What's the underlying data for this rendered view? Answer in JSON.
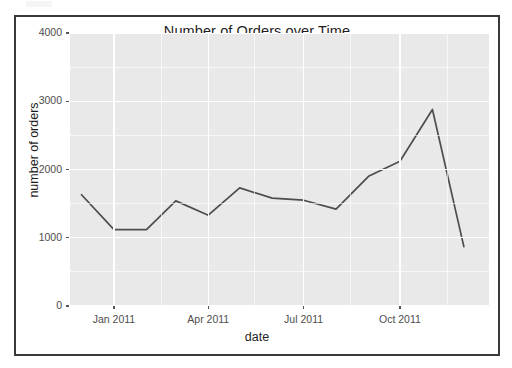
{
  "figure": {
    "title": "Number of Orders over Time",
    "background": "#ffffff",
    "panel_background": "#e9e9e9",
    "grid_color": "#ffffff",
    "border_color": "#3a3a3a",
    "line_color": "#4d4d4d"
  },
  "chart_data": {
    "type": "line",
    "title": "Number of Orders over Time",
    "xlabel": "date",
    "ylabel": "number of orders",
    "x": [
      "2010-12-01",
      "2011-01-01",
      "2011-02-01",
      "2011-03-01",
      "2011-04-01",
      "2011-05-01",
      "2011-06-01",
      "2011-07-01",
      "2011-08-01",
      "2011-09-01",
      "2011-10-01",
      "2011-11-01",
      "2011-12-01"
    ],
    "values": [
      1630,
      1120,
      1120,
      1540,
      1330,
      1730,
      1580,
      1550,
      1420,
      1900,
      2120,
      2880,
      870
    ],
    "series": [
      {
        "name": "number of orders",
        "color": "#4d4d4d",
        "values": [
          1630,
          1120,
          1120,
          1540,
          1330,
          1730,
          1580,
          1550,
          1420,
          1900,
          2120,
          2880,
          870
        ]
      }
    ],
    "ylim": [
      0,
      4000
    ],
    "y_ticks": [
      0,
      1000,
      2000,
      3000,
      4000
    ],
    "y_tick_labels": [
      "0",
      "1000",
      "2000",
      "3000",
      "4000"
    ],
    "y_minor_ticks": [
      500,
      1500,
      2500,
      3500
    ],
    "x_ticks": [
      "2011-01-01",
      "2011-04-01",
      "2011-07-01",
      "2011-10-01"
    ],
    "x_tick_labels": [
      "Jan 2011",
      "Apr 2011",
      "Jul 2011",
      "Oct 2011"
    ],
    "x_minor_ticks": [
      "2011-02-15",
      "2011-05-15",
      "2011-08-15",
      "2011-11-15"
    ],
    "xlim": [
      "2010-11-20",
      "2011-12-25"
    ],
    "grid": true,
    "legend": "none"
  }
}
